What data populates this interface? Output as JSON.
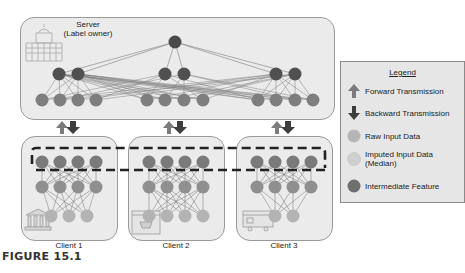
{
  "server": {
    "title_line1": "Server",
    "title_line2": "(Label owner)"
  },
  "clients": [
    {
      "label": "Client 1"
    },
    {
      "label": "Client 2"
    },
    {
      "label": "Client 3"
    }
  ],
  "legend": {
    "title": "Legend",
    "items": [
      {
        "label": "Forward Transmission",
        "icon": "up-arrow",
        "color": "#7b7b7b"
      },
      {
        "label": "Backward Transmission",
        "icon": "down-arrow",
        "color": "#3d3d3d"
      },
      {
        "label": "Raw Input Data",
        "icon": "circle",
        "color": "#b5b5b5"
      },
      {
        "label": "Imputed Input Data (Median)",
        "label_line1": "Imputed Input Data",
        "label_line2": "(Median)",
        "icon": "circle",
        "color": "#cfcfcf"
      },
      {
        "label": "Intermediate Feature",
        "icon": "circle",
        "color": "#6e6e6e"
      }
    ]
  },
  "colors": {
    "output_node": "#4a4a4a",
    "server_hidden_node": "#505050",
    "server_input_node": "#7e7e7e",
    "client_top_node": "#7a7a7a",
    "client_mid_node": "#8f8f8f",
    "client_raw_node": "#b3b3b3",
    "forward_arrow": "#7b7b7b",
    "backward_arrow": "#3d3d3d"
  },
  "caption": "FIGURE 15.1"
}
